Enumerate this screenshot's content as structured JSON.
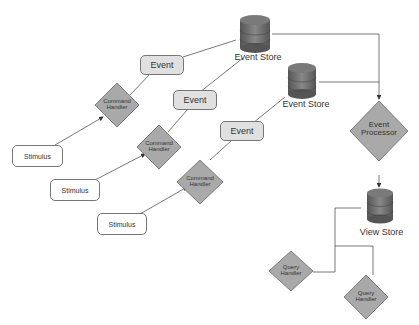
{
  "diagram": {
    "event_stores": [
      {
        "label": "Event Store"
      },
      {
        "label": "Event Store"
      }
    ],
    "view_store": {
      "label": "View Store"
    },
    "event_processor": {
      "label_line1": "Event",
      "label_line2": "Processor"
    },
    "events": [
      {
        "label": "Event"
      },
      {
        "label": "Event"
      },
      {
        "label": "Event"
      }
    ],
    "command_handlers": [
      {
        "label_line1": "Command",
        "label_line2": "Handler"
      },
      {
        "label_line1": "Command",
        "label_line2": "Handler"
      },
      {
        "label_line1": "Command",
        "label_line2": "Handler"
      }
    ],
    "stimuli": [
      {
        "label": "Stimulus"
      },
      {
        "label": "Stimulus"
      },
      {
        "label": "Stimulus"
      }
    ],
    "query_handlers": [
      {
        "label_line1": "Query",
        "label_line2": "Handler"
      },
      {
        "label_line1": "Query",
        "label_line2": "Handler"
      }
    ],
    "colors": {
      "diamond_fill": "#a9a9a9",
      "event_fill": "#e0e0e0",
      "cylinder_fill": "#6e6e6e",
      "line": "#555555"
    }
  }
}
